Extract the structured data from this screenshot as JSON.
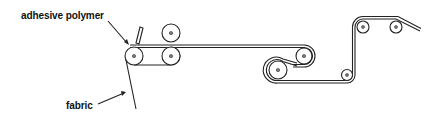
{
  "diagram": {
    "type": "process-schematic",
    "labels": {
      "adhesive_polymer": "adhesive polymer",
      "fabric": "fabric"
    },
    "colors": {
      "line": "#222222",
      "background": "#ffffff"
    },
    "components": [
      {
        "id": "coating-roller",
        "cx": 134,
        "cy": 56,
        "r": 9
      },
      {
        "id": "knife-blade",
        "x": 138,
        "y": 28
      },
      {
        "id": "top-nip-roller",
        "cx": 171,
        "cy": 33,
        "r": 9
      },
      {
        "id": "bottom-nip-roller",
        "cx": 171,
        "cy": 56,
        "r": 9
      },
      {
        "id": "guide-roller-upper",
        "cx": 304,
        "cy": 56,
        "r": 10
      },
      {
        "id": "guide-roller-lower",
        "cx": 278,
        "cy": 70,
        "r": 11
      },
      {
        "id": "guide-roller-bottom-right",
        "cx": 347,
        "cy": 75,
        "r": 7
      },
      {
        "id": "guide-roller-top-1",
        "cx": 363,
        "cy": 27,
        "r": 7
      },
      {
        "id": "guide-roller-top-2",
        "cx": 396,
        "cy": 27,
        "r": 7
      }
    ]
  }
}
